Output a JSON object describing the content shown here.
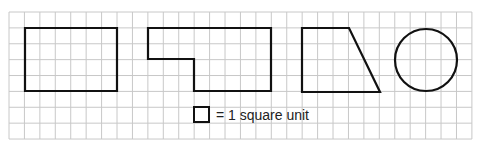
{
  "figure": {
    "grid": {
      "x0": 9,
      "y0": 12,
      "cols": 30,
      "rows": 8,
      "cell_w": 15.43,
      "cell_h": 15.88,
      "line_color": "#c8c8c8"
    },
    "shapes": [
      {
        "name": "rectangle",
        "type": "polygon",
        "points": [
          [
            25,
            28
          ],
          [
            117,
            28
          ],
          [
            117,
            91
          ],
          [
            25,
            91
          ]
        ]
      },
      {
        "name": "l-shape",
        "type": "polygon",
        "points": [
          [
            148,
            28
          ],
          [
            271,
            28
          ],
          [
            271,
            91
          ],
          [
            194,
            91
          ],
          [
            194,
            59
          ],
          [
            148,
            59
          ]
        ]
      },
      {
        "name": "trapezoid",
        "type": "polygon",
        "points": [
          [
            302,
            28
          ],
          [
            349,
            28
          ],
          [
            380,
            92
          ],
          [
            302,
            92
          ]
        ]
      },
      {
        "name": "circle",
        "type": "circle",
        "cx": 426,
        "cy": 60,
        "r": 31
      }
    ],
    "stroke_color": "#111111",
    "legend": {
      "square": {
        "x": 194,
        "y": 107,
        "size": 15
      },
      "text": "= 1 square unit"
    }
  }
}
